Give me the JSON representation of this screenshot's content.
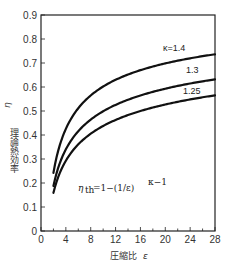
{
  "chart_data": {
    "type": "line",
    "title": "",
    "xlabel": "圧縮比 ε",
    "ylabel": "理論熱効率 η_th",
    "xlim": [
      0,
      28
    ],
    "ylim": [
      0,
      0.9
    ],
    "xticks": [
      0,
      4,
      8,
      12,
      16,
      20,
      24,
      28
    ],
    "yticks": [
      0,
      0.1,
      0.2,
      0.3,
      0.4,
      0.5,
      0.6,
      0.7,
      0.8,
      0.9
    ],
    "xtick_labels": [
      "0",
      "4",
      "8",
      "12",
      "16",
      "20",
      "24",
      "28"
    ],
    "ytick_labels": [
      "0",
      "0.1",
      "0.2",
      "0.3",
      "0.4",
      "0.5",
      "0.6",
      "0.7",
      "0.8",
      "0.9"
    ],
    "grid": false,
    "formula": "η_th = 1 − (1/ε)^(κ−1)",
    "series": [
      {
        "name": "κ=1.4",
        "kappa": 1.4,
        "x": [
          2,
          4,
          6,
          8,
          10,
          12,
          14,
          16,
          18,
          20,
          22,
          24,
          26,
          28
        ],
        "values": [
          0.24,
          0.43,
          0.51,
          0.56,
          0.6,
          0.63,
          0.65,
          0.67,
          0.69,
          0.7,
          0.71,
          0.72,
          0.73,
          0.74
        ]
      },
      {
        "name": "1.3",
        "kappa": 1.3,
        "x": [
          2,
          4,
          6,
          8,
          10,
          12,
          14,
          16,
          18,
          20,
          22,
          24,
          26,
          28
        ],
        "values": [
          0.19,
          0.34,
          0.42,
          0.46,
          0.5,
          0.53,
          0.55,
          0.56,
          0.58,
          0.59,
          0.6,
          0.61,
          0.62,
          0.63
        ]
      },
      {
        "name": "1.25",
        "kappa": 1.25,
        "x": [
          2,
          4,
          6,
          8,
          10,
          12,
          14,
          16,
          18,
          20,
          22,
          24,
          26,
          28
        ],
        "values": [
          0.16,
          0.29,
          0.36,
          0.41,
          0.44,
          0.46,
          0.48,
          0.5,
          0.51,
          0.53,
          0.54,
          0.55,
          0.56,
          0.57
        ]
      }
    ]
  },
  "labels": {
    "ylabel_text": "理論熱効率",
    "ylabel_symbol": "η",
    "ylabel_sub": "th",
    "xlabel_text": "圧縮比",
    "xlabel_symbol": "ε",
    "curve_1": "κ=1.4",
    "curve_2": "1.3",
    "curve_3": "1.25",
    "formula_eta": "η",
    "formula_sub": "th",
    "formula_body": "=1−(1/ε)",
    "formula_exp": "κ−1"
  }
}
